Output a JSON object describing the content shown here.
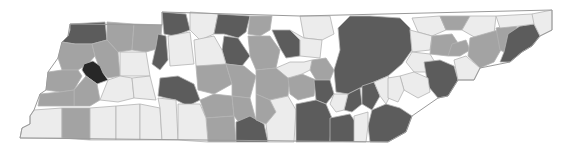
{
  "map": {
    "region": "Tennessee",
    "unit": "county",
    "legend_visible": false,
    "shade_levels": [
      {
        "level": 1,
        "name": "light",
        "color": "#ececec"
      },
      {
        "level": 2,
        "name": "medium",
        "color": "#a3a3a3"
      },
      {
        "level": 3,
        "name": "dark",
        "color": "#5c5c5c"
      },
      {
        "level": 4,
        "name": "darkest",
        "color": "#272727"
      }
    ],
    "counties": [
      {
        "id": "w1",
        "shade": 3,
        "points": "70,24 105,22 107,40 92,44 75,44 62,42 68,36 70,30"
      },
      {
        "id": "w2",
        "shade": 2,
        "points": "107,22 134,24 132,50 118,52 107,40"
      },
      {
        "id": "w3",
        "shade": 2,
        "points": "134,24 162,25 160,48 146,52 132,50"
      },
      {
        "id": "w4",
        "shade": 2,
        "points": "62,42 75,44 92,44 95,56 88,64 78,70 62,70 58,58"
      },
      {
        "id": "w5",
        "shade": 2,
        "points": "92,44 107,40 118,52 120,76 108,78 100,70 95,56"
      },
      {
        "id": "carroll",
        "shade": 4,
        "points": "84,64 93,61 100,66 103,73 108,80 97,84 86,76 82,70"
      },
      {
        "id": "w6",
        "shade": 2,
        "points": "48,72 62,70 78,70 82,76 74,90 60,92 46,90"
      },
      {
        "id": "w7",
        "shade": 2,
        "points": "74,90 86,76 97,84 100,100 90,106 74,106"
      },
      {
        "id": "w8",
        "shade": 2,
        "points": "40,94 60,92 74,90 74,106 58,106 38,106"
      },
      {
        "id": "w9",
        "shade": 1,
        "points": "120,52 146,52 150,76 120,76"
      },
      {
        "id": "w10",
        "shade": 1,
        "points": "108,80 120,76 132,78 134,98 118,102 100,100"
      },
      {
        "id": "w11",
        "shade": 1,
        "points": "132,78 150,76 156,100 134,98"
      },
      {
        "id": "sw1",
        "shade": 1,
        "points": "34,110 62,108 62,138 20,138 22,128 30,124 30,116"
      },
      {
        "id": "sw2",
        "shade": 2,
        "points": "62,108 90,108 90,140 62,138"
      },
      {
        "id": "sw3",
        "shade": 1,
        "points": "90,108 116,106 116,140 90,140"
      },
      {
        "id": "sw4",
        "shade": 1,
        "points": "116,106 140,104 140,140 116,140"
      },
      {
        "id": "sw5",
        "shade": 1,
        "points": "140,104 160,108 162,140 140,140"
      },
      {
        "id": "m1",
        "shade": 3,
        "points": "162,12 186,14 190,30 174,36 164,34"
      },
      {
        "id": "m2",
        "shade": 3,
        "points": "158,34 166,36 168,60 160,70 152,64 156,46"
      },
      {
        "id": "m3",
        "shade": 1,
        "points": "168,36 190,32 194,64 170,66"
      },
      {
        "id": "m4",
        "shade": 3,
        "points": "160,78 178,76 194,84 200,100 188,106 176,100 166,98 158,96"
      },
      {
        "id": "m5",
        "shade": 1,
        "points": "190,12 218,14 214,34 200,40 190,30"
      },
      {
        "id": "m6",
        "shade": 3,
        "points": "218,14 250,16 246,32 238,38 224,34 214,34"
      },
      {
        "id": "m7",
        "shade": 3,
        "points": "224,36 238,38 250,56 242,66 226,64 222,50"
      },
      {
        "id": "m8",
        "shade": 1,
        "points": "194,40 214,36 222,50 226,64 210,70 196,66"
      },
      {
        "id": "m9",
        "shade": 2,
        "points": "196,66 226,64 232,84 214,94 198,90"
      },
      {
        "id": "m10",
        "shade": 2,
        "points": "226,64 244,66 256,76 250,98 232,96 232,84"
      },
      {
        "id": "m11",
        "shade": 2,
        "points": "250,16 272,16 270,30 260,36 248,34"
      },
      {
        "id": "m12",
        "shade": 2,
        "points": "248,36 270,36 280,50 276,68 256,70 250,56"
      },
      {
        "id": "m13",
        "shade": 3,
        "points": "272,30 290,30 300,40 300,56 286,58 280,48"
      },
      {
        "id": "m14",
        "shade": 2,
        "points": "256,70 276,68 290,76 288,96 270,100 256,94"
      },
      {
        "id": "m15",
        "shade": 2,
        "points": "200,100 214,94 232,96 234,116 206,118"
      },
      {
        "id": "m16",
        "shade": 2,
        "points": "232,96 250,98 256,120 240,124 234,116"
      },
      {
        "id": "m17",
        "shade": 2,
        "points": "206,118 234,116 236,142 208,142"
      },
      {
        "id": "m18",
        "shade": 3,
        "points": "236,122 250,116 264,124 268,142 236,142"
      },
      {
        "id": "m19",
        "shade": 2,
        "points": "256,94 270,100 276,112 266,124 256,120"
      },
      {
        "id": "m20",
        "shade": 1,
        "points": "270,100 288,96 296,110 294,142 268,142 266,124 276,112"
      },
      {
        "id": "m21",
        "shade": 1,
        "points": "158,98 176,100 178,140 162,140 160,108"
      },
      {
        "id": "m22",
        "shade": 1,
        "points": "178,104 200,104 206,118 208,142 178,140"
      },
      {
        "id": "c1",
        "shade": 1,
        "points": "300,16 330,16 334,34 322,40 304,38"
      },
      {
        "id": "c2",
        "shade": 1,
        "points": "290,30 304,38 322,40 320,58 300,56 300,40"
      },
      {
        "id": "c3",
        "shade": 2,
        "points": "312,60 326,58 334,70 330,80 316,80 310,70"
      },
      {
        "id": "c4",
        "shade": 2,
        "points": "288,78 302,74 316,80 314,96 298,100 290,94"
      },
      {
        "id": "c5",
        "shade": 1,
        "points": "276,68 290,62 304,62 312,60 310,70 302,74 288,78"
      },
      {
        "id": "c6",
        "shade": 3,
        "points": "314,80 330,80 334,94 326,104 316,100"
      },
      {
        "id": "c7",
        "shade": 3,
        "points": "296,104 316,100 326,104 332,118 330,142 296,142"
      },
      {
        "id": "c8",
        "shade": 3,
        "points": "330,118 350,114 358,126 354,142 330,142"
      },
      {
        "id": "ne-block",
        "shade": 3,
        "points": "338,28 350,16 370,16 400,18 410,28 412,50 402,64 388,76 374,82 360,88 348,94 336,92 334,70 340,50"
      },
      {
        "id": "c9",
        "shade": 3,
        "points": "348,94 360,88 362,104 352,112 344,110"
      },
      {
        "id": "c10",
        "shade": 1,
        "points": "334,94 348,94 344,110 336,112 330,104"
      },
      {
        "id": "c11",
        "shade": 3,
        "points": "362,86 374,82 380,96 372,110 362,104"
      },
      {
        "id": "c12",
        "shade": 1,
        "points": "374,82 388,76 394,88 386,104 380,96"
      },
      {
        "id": "c13",
        "shade": 3,
        "points": "372,110 386,104 400,108 412,116 406,132 388,142 370,142 368,126"
      },
      {
        "id": "c14",
        "shade": 1,
        "points": "354,116 368,112 368,126 366,142 354,142"
      },
      {
        "id": "e1",
        "shade": 1,
        "points": "412,18 440,16 446,30 432,36 418,32"
      },
      {
        "id": "e2",
        "shade": 2,
        "points": "440,16 470,16 462,30 446,30"
      },
      {
        "id": "e3",
        "shade": 1,
        "points": "470,16 496,16 494,34 476,38 462,30"
      },
      {
        "id": "e4",
        "shade": 1,
        "points": "410,30 432,36 430,50 412,52"
      },
      {
        "id": "e5",
        "shade": 2,
        "points": "432,36 452,34 460,46 448,56 430,54"
      },
      {
        "id": "e6",
        "shade": 2,
        "points": "452,44 466,40 470,50 460,56 448,56"
      },
      {
        "id": "e7",
        "shade": 2,
        "points": "470,38 498,30 502,48 494,62 480,68 468,56"
      },
      {
        "id": "e8",
        "shade": 2,
        "points": "496,28 516,24 520,42 508,54 500,50"
      },
      {
        "id": "e9",
        "shade": 3,
        "points": "508,34 520,26 534,24 540,36 532,46 522,52 510,62 500,62 504,52"
      },
      {
        "id": "e10",
        "shade": 1,
        "points": "496,16 532,14 540,18 534,24 520,26 500,28"
      },
      {
        "id": "e11",
        "shade": 1,
        "points": "532,14 552,10 552,30 540,36 534,24"
      },
      {
        "id": "e12",
        "shade": 1,
        "points": "412,52 430,54 436,64 430,72 414,72 406,62"
      },
      {
        "id": "e13",
        "shade": 3,
        "points": "424,62 440,60 454,66 458,80 448,96 438,98 428,86"
      },
      {
        "id": "e14",
        "shade": 1,
        "points": "454,60 466,56 480,68 474,80 458,80"
      },
      {
        "id": "e15",
        "shade": 1,
        "points": "400,76 414,72 428,78 430,92 418,98 404,90"
      },
      {
        "id": "e16",
        "shade": 1,
        "points": "388,78 400,76 404,90 398,102 388,98"
      }
    ],
    "state_outline": "34,110 40,94 46,90 48,72 58,58 62,42 68,36 70,24 162,25 162,12 300,16 552,10 552,30 540,36 532,46 522,52 510,62 480,68 474,80 458,80 448,96 438,98 412,116 406,132 388,142 20,138 22,128 30,124 30,116"
  }
}
